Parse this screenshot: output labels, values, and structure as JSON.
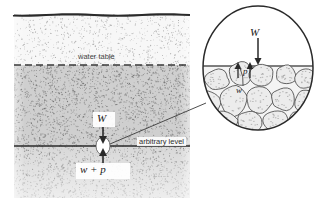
{
  "figure": {
    "type": "geotechnical-cross-section"
  },
  "main_block": {
    "name": "soil-profile-block",
    "x": 14,
    "y": 14,
    "width": 176,
    "height": 184,
    "ground_surface_label": "",
    "unsaturated_zone": {
      "name": "unsaturated-zone",
      "fill": "#f0f0f0",
      "stipple": "fine"
    },
    "saturated_zone": {
      "name": "saturated-zone",
      "fill": "#c8c8c8",
      "stipple": "dense"
    },
    "lower_zone": {
      "name": "lower-saturated-zone",
      "fill": "#d2d2d2"
    }
  },
  "labels": {
    "water_table": "water table",
    "arbitrary_level": "arbitrary level",
    "force_above": "W",
    "force_below": "w + p",
    "inset_load": "W",
    "inset_pressure": "p",
    "inset_grain_force": "w"
  },
  "lines": {
    "ground_surface": {
      "name": "ground-surface-line",
      "y": 15,
      "style": "solid",
      "color": "#2a2a2a"
    },
    "water_table": {
      "name": "water-table-line",
      "y": 65,
      "style": "dashed",
      "color": "#3a3a3a"
    },
    "arbitrary_level": {
      "name": "arbitrary-level-line",
      "y": 146,
      "style": "solid",
      "color": "#2a2a2a"
    }
  },
  "marker": {
    "name": "force-point-marker",
    "shape": "ellipse",
    "cx": 103,
    "cy": 146,
    "rx": 7,
    "ry": 9,
    "fill": "#ffffff"
  },
  "leader_line": {
    "name": "leader-line",
    "from": [
      110,
      144
    ],
    "to": [
      206,
      103
    ]
  },
  "inset": {
    "name": "magnified-pore-detail",
    "cx": 258,
    "cy": 68,
    "rx": 55,
    "ry": 62,
    "water_line_y": 66,
    "grain_fill": "#e8e8e8",
    "grain_count": 13,
    "arrows": {
      "load_arrow": {
        "name": "load-arrow-down",
        "x": 258,
        "y1": 38,
        "y2": 64
      },
      "pore_arrow_left": {
        "name": "pore-arrow-up-left",
        "x": 238,
        "y1": 78,
        "y2": 63
      },
      "pore_arrow_right": {
        "name": "pore-arrow-up-right",
        "x": 250,
        "y1": 78,
        "y2": 63
      },
      "grain_arrow": {
        "name": "grain-force-arrow",
        "x1": 240,
        "y1": 68,
        "x2": 243,
        "y2": 86
      }
    }
  },
  "colors": {
    "ink": "#2a2a2a",
    "stipple_light": "#9a9a9a",
    "stipple_dark": "#6a6a6a",
    "grain_outline": "#4a4a4a",
    "paper": "#ffffff"
  }
}
